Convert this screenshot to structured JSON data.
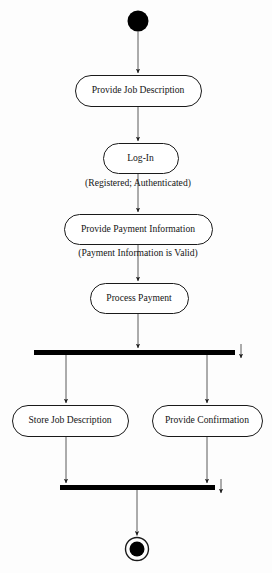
{
  "diagram": {
    "type": "uml-activity-diagram",
    "title": "",
    "colors": {
      "background": "#fdfdfd",
      "stroke": "#1a1a1a",
      "fill": "#ffffff",
      "bar": "#000000",
      "text": "#151515"
    },
    "initial_node": {
      "name": "initial-node",
      "cx": 138,
      "cy": 21,
      "r": 10.5
    },
    "final_node": {
      "name": "final-node",
      "cx": 137,
      "cy": 549,
      "r_outer": 11.5,
      "r_inner": 7.5
    },
    "activities": [
      {
        "id": "provide-job-description",
        "label": "Provide Job Description",
        "x": 75,
        "y": 75,
        "w": 126,
        "h": 31
      },
      {
        "id": "log-in",
        "label": "Log-In",
        "x": 103,
        "y": 143,
        "w": 75,
        "h": 30
      },
      {
        "id": "provide-payment-information",
        "label": "Provide Payment Information",
        "x": 64,
        "y": 214,
        "w": 148,
        "h": 30
      },
      {
        "id": "process-payment",
        "label": "Process Payment",
        "x": 90,
        "y": 283,
        "w": 98,
        "h": 30
      },
      {
        "id": "store-job-description",
        "label": "Store Job Description",
        "x": 12,
        "y": 405,
        "w": 116,
        "h": 31
      },
      {
        "id": "provide-confirmation",
        "label": "Provide Confirmation",
        "x": 152,
        "y": 405,
        "w": 110,
        "h": 31
      }
    ],
    "guards": [
      {
        "id": "guard-registered-authenticated",
        "label": "(Registered; Authenticated)",
        "cx": 138,
        "cy": 183
      },
      {
        "id": "guard-payment-information-valid",
        "label": "(Payment Information is Valid)",
        "cx": 138,
        "cy": 253
      }
    ],
    "bars": [
      {
        "id": "fork-bar",
        "label": "fork",
        "x": 34,
        "y": 350,
        "w": 201,
        "h": 5,
        "end_arrow_x": 241
      },
      {
        "id": "join-bar",
        "label": "join",
        "x": 60,
        "y": 485,
        "w": 155,
        "h": 5,
        "end_arrow_x": 221
      }
    ],
    "flows": [
      {
        "id": "flow-start-to-provide-job-description",
        "from": "initial-node",
        "to": "provide-job-description"
      },
      {
        "id": "flow-provide-job-description-to-log-in",
        "from": "provide-job-description",
        "to": "log-in"
      },
      {
        "id": "flow-log-in-to-provide-payment-information",
        "from": "log-in",
        "to": "provide-payment-information",
        "guard": "(Registered; Authenticated)"
      },
      {
        "id": "flow-provide-payment-information-to-process-payment",
        "from": "provide-payment-information",
        "to": "process-payment",
        "guard": "(Payment Information is Valid)"
      },
      {
        "id": "flow-process-payment-to-fork",
        "from": "process-payment",
        "to": "fork-bar"
      },
      {
        "id": "flow-fork-to-store-job-description",
        "from": "fork-bar",
        "to": "store-job-description"
      },
      {
        "id": "flow-fork-to-provide-confirmation",
        "from": "fork-bar",
        "to": "provide-confirmation"
      },
      {
        "id": "flow-store-job-description-to-join",
        "from": "store-job-description",
        "to": "join-bar"
      },
      {
        "id": "flow-provide-confirmation-to-join",
        "from": "provide-confirmation",
        "to": "join-bar"
      },
      {
        "id": "flow-join-to-final",
        "from": "join-bar",
        "to": "final-node"
      }
    ]
  }
}
